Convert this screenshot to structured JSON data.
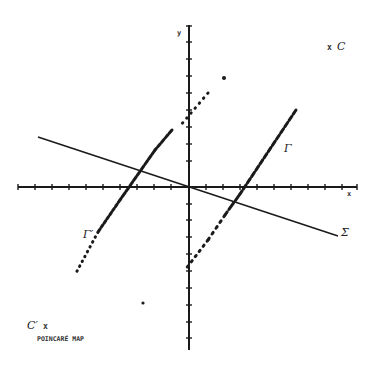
{
  "diagram": {
    "axes": {
      "x_label": "x",
      "y_label": "y",
      "origin": [
        189,
        187
      ],
      "x_range_px": [
        18,
        357
      ],
      "y_range_px": [
        25,
        350
      ],
      "tick_spacing_px": 17
    },
    "curves": [
      {
        "id": "sigma",
        "label": "Σ",
        "style": "solid",
        "from": [
          38,
          137
        ],
        "to": [
          338,
          236
        ]
      },
      {
        "id": "gamma",
        "label": "Γ",
        "style": "dashed",
        "from": [
          296,
          110
        ],
        "to": [
          185,
          270
        ]
      },
      {
        "id": "gamma-prime",
        "label": "Γ′",
        "style": "dotted",
        "from": [
          208,
          93
        ],
        "to": [
          76,
          273
        ]
      }
    ],
    "points": [
      {
        "id": "C",
        "label": "C",
        "marker": "x"
      },
      {
        "id": "C-prime",
        "label": "C′",
        "marker": "x"
      }
    ],
    "labels": {
      "C": "C",
      "C_marker": "x",
      "C_prime": "C′",
      "C_prime_marker": "x",
      "gamma": "Γ",
      "gamma_prime": "Γ′",
      "sigma": "Σ",
      "x_axis": "x",
      "y_axis": "y",
      "caption": "POINCARÉ MAP"
    },
    "colors": {
      "ink": "#1a1a1a",
      "background": "#ffffff"
    }
  }
}
